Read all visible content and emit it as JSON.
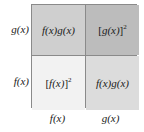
{
  "figure": {
    "type": "area-model-grid",
    "colors": {
      "page_background": "#ffffff",
      "border": "#8a8a8a",
      "text": "#1a1a1a",
      "cell_top_left": "#cfcfcf",
      "cell_top_right": "#bcbcbc",
      "cell_bottom_left": "#f2f2f2",
      "cell_bottom_right": "#dcdcdc"
    }
  },
  "row_labels": [
    {
      "id": "row-g",
      "text": "g(x)"
    },
    {
      "id": "row-f",
      "text": "f(x)"
    }
  ],
  "column_labels": [
    {
      "id": "col-f",
      "text": "f(x)"
    },
    {
      "id": "col-g",
      "text": "g(x)"
    }
  ],
  "cells": {
    "top_left": {
      "id": "cell-fg-top",
      "text": "f(x)g(x)",
      "parts": {
        "base": "f(x)g(x)",
        "exponent": ""
      }
    },
    "top_right": {
      "id": "cell-g-squared",
      "text": "[g(x)]2",
      "parts": {
        "open": "[",
        "base": "g(x)",
        "close": "]",
        "exponent": "2"
      }
    },
    "bottom_left": {
      "id": "cell-f-squared",
      "text": "[f(x)]2",
      "parts": {
        "open": "[",
        "base": "f(x)",
        "close": "]",
        "exponent": "2"
      }
    },
    "bottom_right": {
      "id": "cell-fg-bottom",
      "text": "f(x)g(x)",
      "parts": {
        "base": "f(x)g(x)",
        "exponent": ""
      }
    }
  }
}
